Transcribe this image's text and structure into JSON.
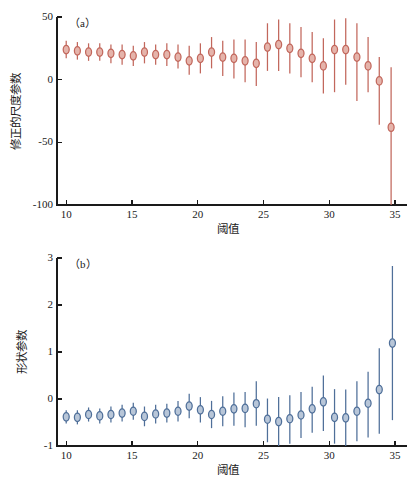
{
  "figure": {
    "background": "#ffffff",
    "width": 417,
    "height": 482
  },
  "chart_data": [
    {
      "id": "panel-a",
      "type": "scatter",
      "panel_tag": "（a）",
      "title": "",
      "xlabel": "阈值",
      "ylabel": "修正的尺度参数",
      "xlim": [
        9.3,
        35.3
      ],
      "ylim": [
        -100,
        50
      ],
      "xticks": [
        10,
        15,
        20,
        25,
        30,
        35
      ],
      "yticks": [
        50,
        0,
        -50,
        -100
      ],
      "xtick_labels": [
        "10",
        "15",
        "20",
        "25",
        "30",
        "35"
      ],
      "ytick_labels": [
        "50",
        "0",
        "-50",
        "-100"
      ],
      "grid": false,
      "legend": "none",
      "marker_color": "#c2675c",
      "marker_face": "#e5b4ab",
      "errorbar_color": "#c2675c",
      "series": [
        {
          "name": "修正的尺度参数",
          "x": [
            10.0,
            10.85,
            11.7,
            12.55,
            13.4,
            14.25,
            15.1,
            15.95,
            16.8,
            17.65,
            18.5,
            19.35,
            20.2,
            21.05,
            21.9,
            22.75,
            23.6,
            24.45,
            25.3,
            26.15,
            27.0,
            27.85,
            28.7,
            29.55,
            30.4,
            31.25,
            32.1,
            32.95,
            33.8,
            34.7
          ],
          "y": [
            24,
            23,
            22,
            22,
            21,
            20,
            19,
            22,
            20,
            20,
            18,
            15,
            17,
            22,
            18,
            17,
            15,
            13,
            26,
            28,
            25,
            21,
            17,
            11,
            24,
            24,
            18,
            11,
            -1,
            -38
          ],
          "y_lower": [
            17,
            16,
            15,
            15,
            13,
            12,
            11,
            13,
            12,
            11,
            9,
            4,
            5,
            9,
            3,
            1,
            -2,
            -5,
            7,
            7,
            5,
            2,
            -2,
            -11,
            -10,
            -4,
            -17,
            -10,
            -36,
            -100
          ],
          "y_upper": [
            31,
            30,
            29,
            29,
            28,
            28,
            27,
            30,
            28,
            29,
            28,
            27,
            29,
            34,
            31,
            32,
            32,
            30,
            45,
            48,
            45,
            42,
            38,
            33,
            48,
            49,
            45,
            34,
            18,
            10
          ]
        }
      ]
    },
    {
      "id": "panel-b",
      "type": "scatter",
      "panel_tag": "（b）",
      "title": "",
      "xlabel": "阈值",
      "ylabel": "形状参数",
      "xlim": [
        9.3,
        35.3
      ],
      "ylim": [
        -1,
        3
      ],
      "xticks": [
        10,
        15,
        20,
        25,
        30,
        35
      ],
      "yticks": [
        3,
        2,
        1,
        0,
        -1
      ],
      "xtick_labels": [
        "10",
        "15",
        "20",
        "25",
        "30",
        "35"
      ],
      "ytick_labels": [
        "3",
        "2",
        "1",
        "0",
        "-1"
      ],
      "grid": false,
      "legend": "none",
      "marker_color": "#4f6f99",
      "marker_face": "#b8c6d8",
      "errorbar_color": "#4f6f99",
      "series": [
        {
          "name": "形状参数",
          "x": [
            10.0,
            10.85,
            11.7,
            12.55,
            13.4,
            14.25,
            15.1,
            15.95,
            16.8,
            17.65,
            18.5,
            19.35,
            20.2,
            21.05,
            21.9,
            22.75,
            23.6,
            24.45,
            25.3,
            26.15,
            27.0,
            27.85,
            28.7,
            29.55,
            30.4,
            31.25,
            32.1,
            32.95,
            33.8,
            34.8
          ],
          "y": [
            -0.38,
            -0.39,
            -0.33,
            -0.36,
            -0.33,
            -0.3,
            -0.26,
            -0.37,
            -0.32,
            -0.3,
            -0.26,
            -0.15,
            -0.23,
            -0.33,
            -0.26,
            -0.21,
            -0.2,
            -0.1,
            -0.43,
            -0.48,
            -0.42,
            -0.34,
            -0.21,
            -0.06,
            -0.39,
            -0.4,
            -0.26,
            -0.09,
            0.2,
            1.19
          ],
          "y_lower": [
            -0.52,
            -0.54,
            -0.48,
            -0.52,
            -0.5,
            -0.48,
            -0.44,
            -0.58,
            -0.52,
            -0.5,
            -0.48,
            -0.41,
            -0.5,
            -0.62,
            -0.58,
            -0.57,
            -0.6,
            -0.57,
            -0.92,
            -1.0,
            -0.95,
            -0.83,
            -0.72,
            -0.68,
            -0.95,
            -1.0,
            -0.9,
            -0.82,
            -0.74,
            -0.45
          ],
          "y_upper": [
            -0.24,
            -0.24,
            -0.18,
            -0.2,
            -0.16,
            -0.12,
            -0.08,
            -0.16,
            -0.12,
            -0.1,
            -0.04,
            0.11,
            0.04,
            -0.04,
            0.06,
            0.14,
            0.15,
            0.38,
            0.01,
            0.04,
            0.08,
            0.15,
            0.26,
            0.5,
            0.21,
            0.2,
            0.38,
            0.58,
            1.08,
            2.83
          ]
        }
      ]
    }
  ]
}
